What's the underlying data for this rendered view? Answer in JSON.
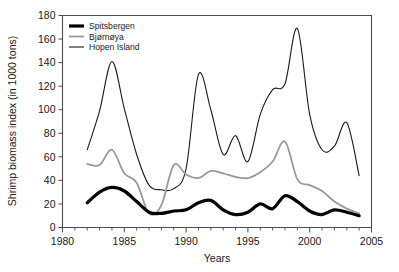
{
  "chart_data": {
    "type": "line",
    "title": "",
    "xlabel": "Years",
    "ylabel": "Shrimp biomass index (in 1000 tons)",
    "xlim": [
      1980,
      2005
    ],
    "ylim": [
      0,
      180
    ],
    "xticks": [
      1980,
      1985,
      1990,
      1995,
      2000,
      2005
    ],
    "xtick_labels": [
      "1980",
      "1985",
      "1990",
      "1995",
      "2000",
      "2005"
    ],
    "xminor_step": 1,
    "yticks": [
      0,
      20,
      40,
      60,
      80,
      100,
      120,
      140,
      160,
      180
    ],
    "ytick_labels": [
      "0",
      "20",
      "40",
      "60",
      "80",
      "100",
      "120",
      "140",
      "160",
      "180"
    ],
    "grid": false,
    "legend_position": "top-left",
    "x": [
      1982,
      1983,
      1984,
      1985,
      1986,
      1987,
      1988,
      1989,
      1990,
      1991,
      1992,
      1993,
      1994,
      1995,
      1996,
      1997,
      1998,
      1999,
      2000,
      2001,
      2002,
      2003,
      2004
    ],
    "series": [
      {
        "name": "Spitsbergen",
        "color": "#000000",
        "width": 3.2,
        "values": [
          21,
          30,
          34,
          31,
          22,
          13,
          12,
          14,
          15,
          21,
          23,
          15,
          11,
          13,
          20,
          16,
          27,
          22,
          14,
          11,
          15,
          13,
          10
        ]
      },
      {
        "name": "Bjørnøya",
        "color": "#9a9a9a",
        "width": 1.8,
        "values": [
          54,
          53,
          66,
          46,
          38,
          12,
          19,
          53,
          45,
          42,
          48,
          46,
          43,
          42,
          47,
          56,
          73,
          41,
          36,
          31,
          22,
          16,
          12
        ]
      },
      {
        "name": "Hopen Island",
        "color": "#1a1a1a",
        "width": 1.1,
        "values": [
          66,
          99,
          141,
          101,
          62,
          36,
          32,
          33,
          50,
          130,
          100,
          62,
          78,
          56,
          96,
          117,
          122,
          169,
          96,
          66,
          69,
          89,
          44
        ]
      }
    ]
  },
  "legend": {
    "items": [
      {
        "label": "Spitsbergen"
      },
      {
        "label": "Bjørnøya"
      },
      {
        "label": "Hopen Island"
      }
    ]
  }
}
